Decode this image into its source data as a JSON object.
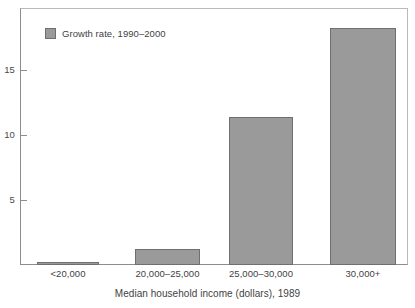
{
  "chart_data": {
    "type": "bar",
    "title": "",
    "subtitle": "",
    "categories": [
      "<20,000",
      "20,000–25,000",
      "25,000–30,000",
      "30,000+"
    ],
    "values": [
      0.2,
      1.2,
      11.4,
      18.2
    ],
    "series": [
      {
        "name": "Growth rate, 1990–2000",
        "values": [
          0.2,
          1.2,
          11.4,
          18.2
        ],
        "color": "#9a9a9a"
      }
    ],
    "xlabel": "Median household income (dollars), 1989",
    "ylabel": "",
    "ylim": [
      0,
      19.8
    ],
    "yticks": [
      5,
      10,
      15
    ],
    "ytick_labels": [
      "5",
      "10",
      "15"
    ],
    "grid": false,
    "legend": {
      "position": "top-left",
      "entries": [
        {
          "label": "Growth rate, 1990–2000",
          "color": "#9a9a9a"
        }
      ]
    }
  },
  "legend": {
    "entry_label": "Growth rate, 1990–2000"
  },
  "axes": {
    "x_title": "Median household income (dollars), 1989",
    "x_labels": [
      "<20,000",
      "20,000–25,000",
      "25,000–30,000",
      "30,000+"
    ],
    "y_labels": [
      "15",
      "10",
      "5"
    ]
  },
  "colors": {
    "bar_fill": "#9a9a9a",
    "bar_border": "#6f6f6f",
    "axis": "#8d8d8d",
    "text": "#3f3f3f",
    "background": "#ffffff"
  }
}
